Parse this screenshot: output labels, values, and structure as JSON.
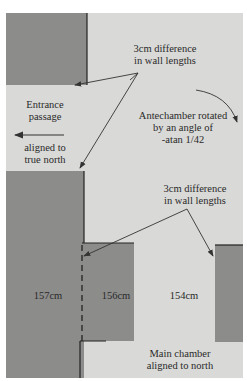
{
  "diagram": {
    "labels": {
      "top_diff_line1": "3cm difference",
      "top_diff_line2": "in wall lengths",
      "entrance_line1": "Entrance",
      "entrance_line2": "passage",
      "entrance_align_line1": "aligned to",
      "entrance_align_line2": "true north",
      "antechamber_line1": "Antechamber rotated",
      "antechamber_line2": "by an angle of",
      "antechamber_line3": "-atan 1/42",
      "bottom_diff_line1": "3cm difference",
      "bottom_diff_line2": "in wall lengths",
      "wall_left": "157cm",
      "wall_middle": "156cm",
      "wall_right": "154cm",
      "main_line1": "Main chamber",
      "main_line2": "aligned to north"
    },
    "colors": {
      "background": "#d9d9d7",
      "wall": "#8c8c8a",
      "line": "#333333"
    }
  }
}
